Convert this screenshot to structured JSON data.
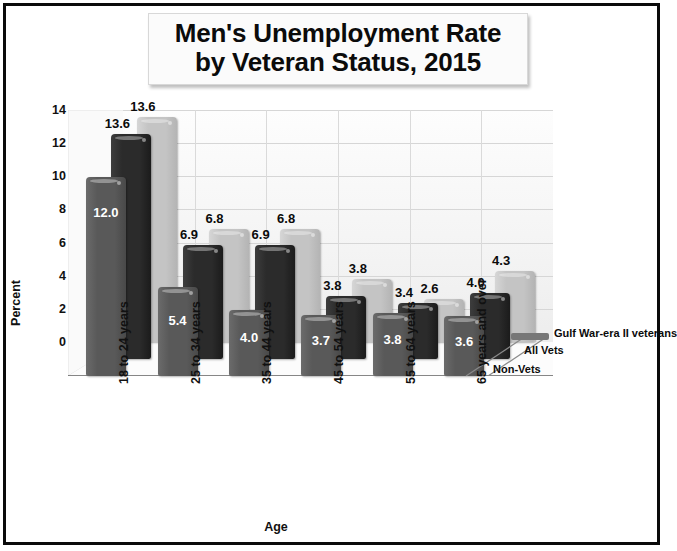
{
  "title": {
    "line1": "Men's Unemployment Rate",
    "line2": "by Veteran Status, 2015"
  },
  "chart_data": {
    "type": "bar",
    "title": "Men's Unemployment Rate by Veteran Status, 2015",
    "xlabel": "Age",
    "ylabel": "Percent",
    "ylim": [
      0,
      14
    ],
    "yticks": [
      "0",
      "2",
      "4",
      "6",
      "8",
      "10",
      "12",
      "14"
    ],
    "grid": true,
    "legend_position": "depth-axis",
    "categories": [
      "18 to 24 years",
      "25 to 34 years",
      "35 to 44 years",
      "45 to 54 years",
      "55 to 64 years",
      "65 years and over"
    ],
    "series": [
      {
        "name": "Non-Vets",
        "color": "#595959",
        "values": [
          12.0,
          5.4,
          4.0,
          3.7,
          3.8,
          3.6
        ],
        "labels": [
          "12.0",
          "5.4",
          "4.0",
          "3.7",
          "3.8",
          "3.6"
        ]
      },
      {
        "name": "All Vets",
        "color": "#2b2b2b",
        "values": [
          13.6,
          6.9,
          6.9,
          3.8,
          3.4,
          4.0
        ],
        "labels": [
          "13.6",
          "6.9",
          "6.9",
          "3.8",
          "3.4",
          "4.0"
        ]
      },
      {
        "name": "Gulf War-era II veterans",
        "color": "#c4c4c4",
        "values": [
          13.6,
          6.8,
          6.8,
          3.8,
          2.6,
          4.3
        ],
        "labels": [
          "13.6",
          "6.8",
          "6.8",
          "3.8",
          "2.6",
          "4.3"
        ]
      }
    ]
  },
  "series_labels": {
    "non_vets": "Non-Vets",
    "all_vets": "All Vets",
    "gulf_war": "Gulf War-era II veterans"
  },
  "colors": {
    "non_vets": "#595959",
    "all_vets": "#2b2b2b",
    "gulf_war": "#c4c4c4",
    "frame": "#0a0a0a",
    "grid": "#d6d6d6",
    "wall": "#f4f4f4"
  }
}
